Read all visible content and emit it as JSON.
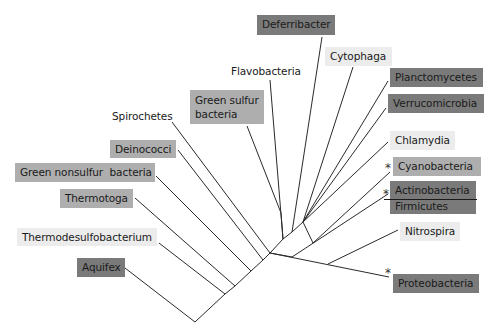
{
  "diagram": {
    "type": "phylogenetic-tree",
    "colors": {
      "shade_dark": "#7a7a7a",
      "shade_medium": "#aeaeae",
      "shade_light": "#ececec",
      "none": "transparent",
      "line": "#2a2a2a"
    },
    "labels": {
      "deferribacter": {
        "text": "Deferribacter",
        "shade": "dark"
      },
      "cytophaga": {
        "text": "Cytophaga",
        "shade": "light"
      },
      "flavobacteria": {
        "text": "Flavobacteria",
        "shade": "none"
      },
      "planctomycetes": {
        "text": "Planctomycetes",
        "shade": "dark"
      },
      "verrucomicrobia": {
        "text": "Verrucomicrobia",
        "shade": "dark"
      },
      "green_sulfur": {
        "text": "Green sulfur bacteria",
        "line1": "Green sulfur",
        "line2": "bacteria",
        "shade": "medium"
      },
      "spirochetes": {
        "text": "Spirochetes",
        "shade": "none"
      },
      "chlamydia": {
        "text": "Chlamydia",
        "shade": "light"
      },
      "deinococci": {
        "text": "Deinococci",
        "shade": "medium"
      },
      "cyanobacteria": {
        "text": "Cyanobacteria",
        "shade": "medium",
        "asterisk": "*"
      },
      "green_nonsulfur": {
        "text": "Green nonsulfur  bacteria",
        "shade": "medium"
      },
      "actinobacteria": {
        "text": "Actinobacteria",
        "shade": "dark",
        "asterisk": "*"
      },
      "firmicutes": {
        "text": "Firmicutes",
        "shade": "dark"
      },
      "thermotoga": {
        "text": "Thermotoga",
        "shade": "medium"
      },
      "nitrospira": {
        "text": "Nitrospira",
        "shade": "light"
      },
      "thermodesulfobacterium": {
        "text": "Thermodesulfobacterium",
        "shade": "light"
      },
      "aquifex": {
        "text": "Aquifex",
        "shade": "dark"
      },
      "proteobacteria": {
        "text": "Proteobacteria",
        "shade": "dark",
        "asterisk": "*"
      }
    },
    "root": [
      195,
      322
    ],
    "backbone": [
      [
        195,
        322
      ],
      [
        225,
        294
      ],
      [
        235,
        286
      ],
      [
        251,
        271
      ],
      [
        263,
        260
      ],
      [
        270,
        253
      ],
      [
        283,
        239
      ],
      [
        292,
        232
      ],
      [
        303,
        222
      ]
    ],
    "branches": [
      {
        "to": "aquifex",
        "from": [
          195,
          322
        ],
        "end": [
          125,
          268
        ]
      },
      {
        "to": "thermodesulfobacterium",
        "from": [
          225,
          294
        ],
        "end": [
          159,
          243
        ]
      },
      {
        "to": "thermotoga",
        "from": [
          235,
          286
        ],
        "end": [
          135,
          198
        ]
      },
      {
        "to": "green_nonsulfur",
        "from": [
          251,
          271
        ],
        "end": [
          156,
          176
        ]
      },
      {
        "to": "deinococci",
        "from": [
          263,
          260
        ],
        "end": [
          178,
          150
        ]
      },
      {
        "to": "spirochetes",
        "from": [
          270,
          253
        ],
        "end": [
          172,
          122
        ]
      },
      {
        "to": "green_sulfur",
        "from": [
          281,
          213
        ],
        "end": [
          247,
          126
        ]
      },
      {
        "to": "flavobacteria",
        "from": [
          283,
          239
        ],
        "end": [
          270,
          80
        ]
      },
      {
        "to": "deferribacter",
        "from": [
          292,
          232
        ],
        "end": [
          322,
          37
        ]
      },
      {
        "to": "cytophaga",
        "from": [
          303,
          222
        ],
        "end": [
          353,
          67
        ]
      },
      {
        "to": "planctomycetes",
        "from": [
          303,
          222
        ],
        "end": [
          388,
          81
        ]
      },
      {
        "to": "verrucomicrobia",
        "from": [
          303,
          222
        ],
        "end": [
          386,
          108
        ]
      },
      {
        "to": "chlamydia",
        "from": [
          303,
          222
        ],
        "end": [
          388,
          142
        ]
      },
      {
        "to": "cyanobacteria",
        "from": [
          313,
          243
        ],
        "end": [
          390,
          172
        ]
      },
      {
        "to": "actinobacteria",
        "from": [
          292,
          257
        ],
        "end": [
          388,
          194
        ]
      },
      {
        "to": "nitrospira",
        "from": [
          328,
          264
        ],
        "end": [
          398,
          230
        ]
      },
      {
        "to": "proteobacteria",
        "from": [
          270,
          253
        ],
        "end": [
          389,
          277
        ]
      }
    ],
    "internal_segments": [
      [
        [
          281,
          213
        ],
        [
          283,
          239
        ]
      ],
      [
        [
          303,
          222
        ],
        [
          313,
          243
        ]
      ],
      [
        [
          270,
          253
        ],
        [
          292,
          257
        ]
      ]
    ],
    "separator_line": {
      "x1": 384,
      "y1": 199,
      "x2": 477,
      "y2": 199
    }
  }
}
